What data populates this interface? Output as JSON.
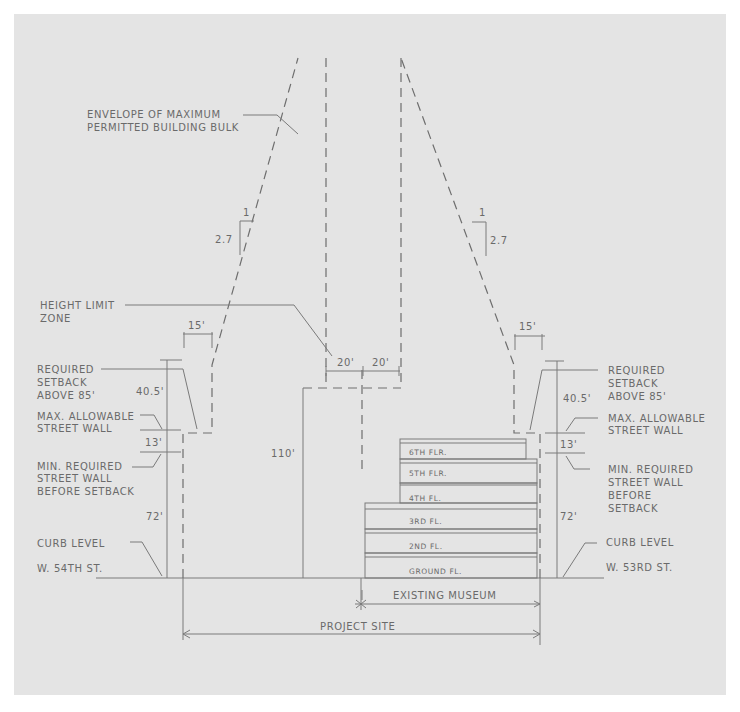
{
  "diagram": {
    "colors": {
      "panel": "#e4e4e4",
      "line": "#7a7a7a",
      "text": "#6a6a6a"
    },
    "labels": {
      "envelope_line1": "ENVELOPE OF MAXIMUM",
      "envelope_line2": "PERMITTED BUILDING BULK",
      "height_limit_line1": "HEIGHT LIMIT",
      "height_limit_line2": "ZONE",
      "left": {
        "setback_line1": "REQUIRED",
        "setback_line2": "SETBACK",
        "setback_line3": "ABOVE 85'",
        "max_wall_line1": "MAX. ALLOWABLE",
        "max_wall_line2": "STREET WALL",
        "min_wall_line1": "MIN. REQUIRED",
        "min_wall_line2": "STREET WALL",
        "min_wall_line3": "BEFORE SETBACK",
        "curb": "CURB LEVEL",
        "street": "W. 54TH ST."
      },
      "right": {
        "setback_line1": "REQUIRED",
        "setback_line2": "SETBACK",
        "setback_line3": "ABOVE 85'",
        "max_wall_line1": "MAX. ALLOWABLE",
        "max_wall_line2": "STREET WALL",
        "min_wall_line1": "MIN. REQUIRED",
        "min_wall_line2": "STREET WALL",
        "min_wall_line3": "BEFORE",
        "min_wall_line4": "SETBACK",
        "curb": "CURB LEVEL",
        "street": "W. 53RD ST."
      },
      "existing_museum": "EXISTING MUSEUM",
      "project_site": "PROJECT SITE"
    },
    "dimensions": {
      "slope_rise": "2.7",
      "slope_run": "1",
      "setback_left": "15'",
      "setback_right": "15'",
      "height_limit_left": "20'",
      "height_limit_right": "20'",
      "left_setback_height": "40.5'",
      "right_setback_height": "40.5'",
      "left_wall_diff": "13'",
      "right_wall_diff": "13'",
      "left_min_wall": "72'",
      "right_min_wall": "72'",
      "height_limit": "110'"
    },
    "floors": [
      "6TH FLR.",
      "5TH FLR.",
      "4TH FL.",
      "3RD FL.",
      "2ND FL.",
      "GROUND FL."
    ]
  }
}
